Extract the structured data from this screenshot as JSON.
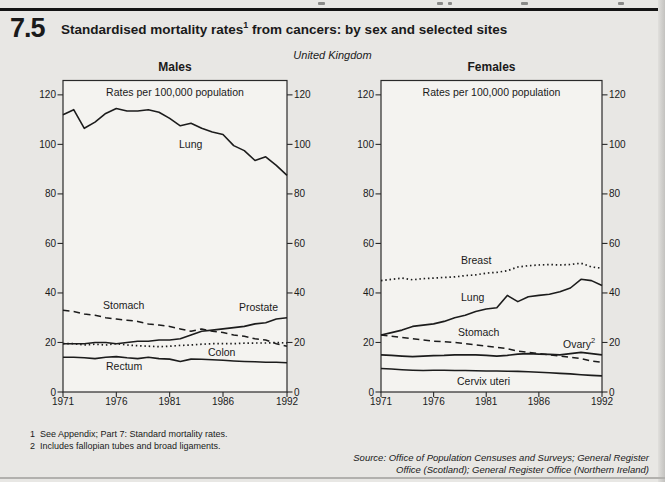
{
  "page": {
    "figure_number": "7.5",
    "title_main": "Standardised mortality rates",
    "title_footnote_marker": "1",
    "title_rest": " from cancers: by sex and selected sites",
    "region_label": "United Kingdom",
    "footnotes": [
      {
        "marker": "1",
        "text": "See Appendix; Part 7: Standard mortality rates."
      },
      {
        "marker": "2",
        "text": "Includes fallopian tubes and broad ligaments."
      }
    ],
    "source_lines": [
      "Source: Office of Population Censuses and Surveys; General Register",
      "Office (Scotland); General Register Office (Northern Ireland)"
    ]
  },
  "colors": {
    "background": "#e8e7e4",
    "plot_fill": "#f4f3f0",
    "line": "#1c1c1c",
    "border": "#2a2a2a"
  },
  "chart_data": [
    {
      "type": "line",
      "title": "Males",
      "inner_label": "Rates per 100,000 population",
      "xlabel": "",
      "ylabel": "Rates per 100,000 population",
      "years": [
        1971,
        1972,
        1973,
        1974,
        1975,
        1976,
        1977,
        1978,
        1979,
        1980,
        1981,
        1982,
        1983,
        1984,
        1985,
        1986,
        1987,
        1988,
        1989,
        1990,
        1991,
        1992
      ],
      "x_ticks": [
        1971,
        1976,
        1981,
        1986,
        1992
      ],
      "y_ticks": [
        0,
        20,
        40,
        60,
        80,
        100,
        120
      ],
      "ylim": [
        0,
        126
      ],
      "grid": false,
      "legend_position": "inline-labels",
      "series": [
        {
          "name": "Lung",
          "style": "solid",
          "values": [
            112,
            114,
            106.5,
            109,
            112.5,
            114.5,
            113.5,
            113.5,
            114,
            113,
            110.5,
            107.5,
            108.5,
            106.5,
            105,
            104,
            99.5,
            97.5,
            93.5,
            95,
            91.5,
            87.5
          ]
        },
        {
          "name": "Stomach",
          "style": "dashed",
          "values": [
            33,
            32.5,
            31.5,
            31,
            30,
            29.5,
            29,
            28.5,
            27.5,
            27,
            26.5,
            25.5,
            24.5,
            25.5,
            24.5,
            24,
            23,
            22.5,
            21.5,
            21,
            19.5,
            18.5
          ]
        },
        {
          "name": "Prostate",
          "style": "solid",
          "values": [
            19.5,
            19.5,
            19.5,
            20,
            20,
            19.5,
            20,
            20.5,
            20.5,
            21,
            21,
            21.5,
            23,
            24.5,
            25,
            25.5,
            26,
            26.5,
            27.5,
            28,
            29.5,
            30
          ]
        },
        {
          "name": "Colon",
          "style": "dotted",
          "values": [
            19.5,
            19.5,
            19,
            19.3,
            19,
            19.5,
            19,
            18.7,
            18.5,
            18.3,
            18.5,
            18.8,
            19,
            19.3,
            19.5,
            19.5,
            19.5,
            19.7,
            19.8,
            19.8,
            20,
            19.8
          ]
        },
        {
          "name": "Rectum",
          "style": "solid",
          "values": [
            14,
            14,
            13.8,
            13.5,
            14,
            14.3,
            13.8,
            13.5,
            14,
            13.5,
            13.3,
            12.3,
            13.3,
            13.2,
            13,
            12.8,
            12.5,
            12.3,
            12.2,
            12,
            12,
            11.8
          ]
        }
      ]
    },
    {
      "type": "line",
      "title": "Females",
      "inner_label": "Rates per 100,000 population",
      "xlabel": "",
      "ylabel": "Rates per 100,000 population",
      "years": [
        1971,
        1972,
        1973,
        1974,
        1975,
        1976,
        1977,
        1978,
        1979,
        1980,
        1981,
        1982,
        1983,
        1984,
        1985,
        1986,
        1987,
        1988,
        1989,
        1990,
        1991,
        1992
      ],
      "x_ticks": [
        1971,
        1976,
        1981,
        1986,
        1992
      ],
      "y_ticks": [
        0,
        20,
        40,
        60,
        80,
        100,
        120
      ],
      "ylim": [
        0,
        126
      ],
      "grid": false,
      "legend_position": "inline-labels",
      "series": [
        {
          "name": "Breast",
          "style": "dotted",
          "values": [
            45,
            45.5,
            46,
            45.3,
            45.8,
            46,
            46.3,
            46.5,
            47,
            47.3,
            48,
            48.3,
            49,
            50.5,
            51,
            51.3,
            51.5,
            51.3,
            51.5,
            52,
            50.5,
            50
          ]
        },
        {
          "name": "Lung",
          "style": "solid",
          "values": [
            23,
            24,
            25,
            26.5,
            27,
            27.5,
            28.5,
            30,
            31,
            32.5,
            33.5,
            34,
            39,
            36.5,
            38.5,
            39,
            39.5,
            40.5,
            42,
            45.5,
            45,
            43
          ]
        },
        {
          "name": "Stomach",
          "style": "dashed",
          "values": [
            23,
            22.5,
            22,
            21.5,
            21,
            20.5,
            20.3,
            20,
            19.5,
            19,
            18.5,
            18,
            17.5,
            16.5,
            16,
            15.5,
            15,
            14.5,
            14,
            13.5,
            12.5,
            12
          ]
        },
        {
          "name": "Ovary",
          "footnote_marker": "2",
          "style": "solid",
          "values": [
            15,
            14.8,
            14.5,
            14.3,
            14.5,
            14.7,
            14.8,
            15,
            15,
            15,
            14.8,
            14.5,
            14.8,
            15.3,
            15.5,
            15.3,
            15.2,
            15,
            15.5,
            16,
            15.5,
            15
          ]
        },
        {
          "name": "Cervix uteri",
          "style": "solid",
          "values": [
            9.5,
            9.3,
            9,
            8.8,
            8.7,
            8.8,
            8.8,
            8.7,
            8.7,
            8.6,
            8.5,
            8.5,
            8.4,
            8.3,
            8.2,
            8,
            7.8,
            7.5,
            7.3,
            7,
            6.7,
            6.5
          ]
        }
      ]
    }
  ]
}
